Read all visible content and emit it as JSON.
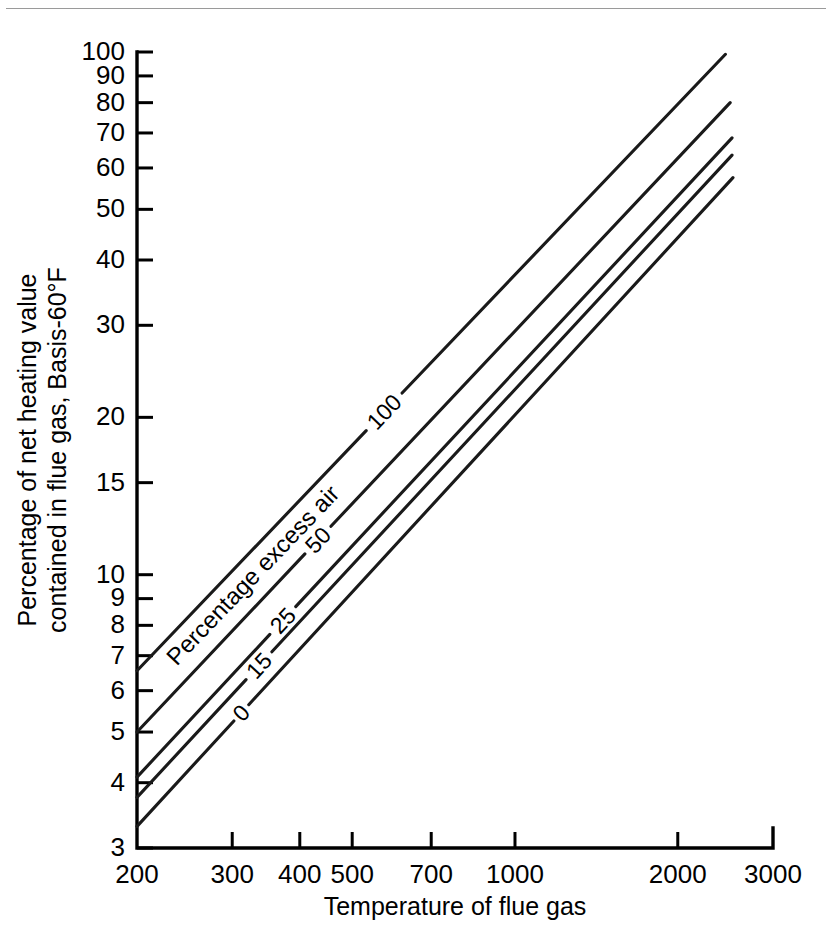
{
  "figure": {
    "bottom_caption": "·········································································································",
    "top_rule_color": "#9a9a9a"
  },
  "chart_data": {
    "type": "line",
    "title": "",
    "xlabel": "Temperature of flue gas",
    "ylabel_line1": "Percentage of net heating value",
    "ylabel_line2": "contained in flue gas, Basis-60°F",
    "xscale": "log",
    "yscale": "log",
    "xlim": [
      200,
      3000
    ],
    "ylim": [
      3,
      100
    ],
    "grid": false,
    "legend_position": "inline-curve-labels",
    "series_group_label": "Percentage excess air",
    "xticks": [
      200,
      300,
      400,
      500,
      700,
      1000,
      2000,
      3000
    ],
    "xtick_labels": [
      "200",
      "300",
      "400",
      "500",
      "700",
      "1000",
      "2000",
      "3000"
    ],
    "yticks": [
      3,
      4,
      5,
      6,
      7,
      8,
      9,
      10,
      15,
      20,
      30,
      40,
      50,
      60,
      70,
      80,
      90,
      100
    ],
    "ytick_labels": [
      "3",
      "4",
      "5",
      "6",
      "7",
      "8",
      "9",
      "10",
      "15",
      "20",
      "30",
      "40",
      "50",
      "60",
      "70",
      "80",
      "90",
      "100"
    ],
    "series": [
      {
        "name": "100",
        "label": "100",
        "x": [
          200,
          2450
        ],
        "y": [
          6.55,
          99.0
        ]
      },
      {
        "name": "50",
        "label": "50",
        "x": [
          200,
          2500
        ],
        "y": [
          5.0,
          80.0
        ]
      },
      {
        "name": "25",
        "label": "25",
        "x": [
          200,
          2520
        ],
        "y": [
          4.1,
          68.5
        ]
      },
      {
        "name": "15",
        "label": "15",
        "x": [
          200,
          2520
        ],
        "y": [
          3.75,
          63.5
        ]
      },
      {
        "name": "0",
        "label": "0",
        "x": [
          200,
          2530
        ],
        "y": [
          3.3,
          57.5
        ]
      }
    ]
  }
}
